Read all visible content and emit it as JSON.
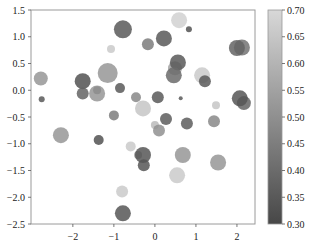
{
  "chart_data": {
    "type": "scatter",
    "title": "",
    "xlabel": "",
    "ylabel": "",
    "xlim": [
      -3.02,
      2.44
    ],
    "ylim": [
      -2.5,
      1.5
    ],
    "grid": false,
    "x_ticks": [
      -2,
      -1,
      0,
      1,
      2
    ],
    "x_tick_labels": [
      "−2",
      "−1",
      "0",
      "1",
      "2"
    ],
    "y_ticks": [
      1.5,
      1.0,
      0.5,
      0.0,
      -0.5,
      -1.0,
      -1.5,
      -2.0,
      -2.5
    ],
    "y_tick_labels": [
      "1.5",
      "1.0",
      "0.5",
      "0.0",
      "−0.5",
      "−1.0",
      "−1.5",
      "−2.0",
      "−2.5"
    ],
    "colorbar": {
      "range": [
        0.3,
        0.7
      ],
      "ticks": [
        0.7,
        0.65,
        0.6,
        0.55,
        0.5,
        0.45,
        0.4,
        0.35,
        0.3
      ],
      "tick_labels": [
        "0.70",
        "0.65",
        "0.60",
        "0.55",
        "0.50",
        "0.45",
        "0.40",
        "0.35",
        "0.30"
      ],
      "colormap": "gray",
      "low_color": "#474747",
      "high_color": "#d8d8d8"
    },
    "alpha": 0.85,
    "points": [
      {
        "x": -0.78,
        "y": 1.14,
        "size": 9,
        "c": 0.35
      },
      {
        "x": -0.17,
        "y": 0.86,
        "size": 6,
        "c": 0.45
      },
      {
        "x": 0.22,
        "y": 0.97,
        "size": 8,
        "c": 0.35
      },
      {
        "x": 0.59,
        "y": 1.31,
        "size": 8,
        "c": 0.68
      },
      {
        "x": 0.83,
        "y": 1.14,
        "size": 3,
        "c": 0.33
      },
      {
        "x": -1.07,
        "y": 0.77,
        "size": 4,
        "c": 0.66
      },
      {
        "x": -1.15,
        "y": 0.32,
        "size": 10,
        "c": 0.52
      },
      {
        "x": -2.78,
        "y": 0.22,
        "size": 7,
        "c": 0.52
      },
      {
        "x": -1.76,
        "y": 0.17,
        "size": 8,
        "c": 0.33
      },
      {
        "x": -1.41,
        "y": 0.0,
        "size": 4,
        "c": 0.34
      },
      {
        "x": -1.76,
        "y": -0.06,
        "size": 6,
        "c": 0.38
      },
      {
        "x": -1.41,
        "y": -0.06,
        "size": 8,
        "c": 0.52
      },
      {
        "x": -2.76,
        "y": -0.17,
        "size": 3,
        "c": 0.35
      },
      {
        "x": -0.85,
        "y": 0.04,
        "size": 5,
        "c": 0.35
      },
      {
        "x": -0.46,
        "y": -0.13,
        "size": 5,
        "c": 0.48
      },
      {
        "x": -0.29,
        "y": -0.34,
        "size": 8,
        "c": 0.65
      },
      {
        "x": 0.49,
        "y": 0.41,
        "size": 7,
        "c": 0.55
      },
      {
        "x": 0.56,
        "y": 0.52,
        "size": 8,
        "c": 0.35
      },
      {
        "x": 0.46,
        "y": 0.28,
        "size": 8,
        "c": 0.4
      },
      {
        "x": 1.15,
        "y": 0.28,
        "size": 8,
        "c": 0.66
      },
      {
        "x": 1.22,
        "y": 0.17,
        "size": 6,
        "c": 0.35
      },
      {
        "x": 2.12,
        "y": 0.8,
        "size": 8,
        "c": 0.42
      },
      {
        "x": 2.0,
        "y": 0.79,
        "size": 8,
        "c": 0.38
      },
      {
        "x": 2.17,
        "y": -0.24,
        "size": 7,
        "c": 0.38
      },
      {
        "x": 2.07,
        "y": -0.15,
        "size": 8,
        "c": 0.34
      },
      {
        "x": 0.07,
        "y": -0.13,
        "size": 6,
        "c": 0.35
      },
      {
        "x": 0.63,
        "y": -0.15,
        "size": 2,
        "c": 0.35
      },
      {
        "x": 1.49,
        "y": -0.28,
        "size": 4,
        "c": 0.65
      },
      {
        "x": 1.44,
        "y": -0.58,
        "size": 6,
        "c": 0.48
      },
      {
        "x": 0.27,
        "y": -0.54,
        "size": 6,
        "c": 0.36
      },
      {
        "x": 0.78,
        "y": -0.62,
        "size": 6,
        "c": 0.36
      },
      {
        "x": 0.0,
        "y": -0.65,
        "size": 4,
        "c": 0.62
      },
      {
        "x": 0.1,
        "y": -0.75,
        "size": 6,
        "c": 0.5
      },
      {
        "x": -1.0,
        "y": -0.47,
        "size": 5,
        "c": 0.45
      },
      {
        "x": -2.29,
        "y": -0.84,
        "size": 8,
        "c": 0.52
      },
      {
        "x": -1.37,
        "y": -0.93,
        "size": 5,
        "c": 0.33
      },
      {
        "x": -0.59,
        "y": -1.05,
        "size": 5,
        "c": 0.66
      },
      {
        "x": -0.41,
        "y": -1.21,
        "size": 4,
        "c": 0.5
      },
      {
        "x": -0.29,
        "y": -1.21,
        "size": 8,
        "c": 0.34
      },
      {
        "x": -0.27,
        "y": -1.4,
        "size": 6,
        "c": 0.34
      },
      {
        "x": 0.68,
        "y": -1.21,
        "size": 8,
        "c": 0.52
      },
      {
        "x": 1.54,
        "y": -1.35,
        "size": 8,
        "c": 0.52
      },
      {
        "x": 0.54,
        "y": -1.59,
        "size": 8,
        "c": 0.66
      },
      {
        "x": -0.8,
        "y": -1.89,
        "size": 6,
        "c": 0.66
      },
      {
        "x": -0.78,
        "y": -2.3,
        "size": 8,
        "c": 0.34
      }
    ]
  },
  "layout": {
    "plot": {
      "left": 31,
      "top": 10,
      "right": 255,
      "bottom": 224
    },
    "colorbar": {
      "left": 268,
      "top": 10,
      "right": 282,
      "bottom": 224
    },
    "frame_color": "#9a9a9a",
    "tick_color": "#555555"
  }
}
